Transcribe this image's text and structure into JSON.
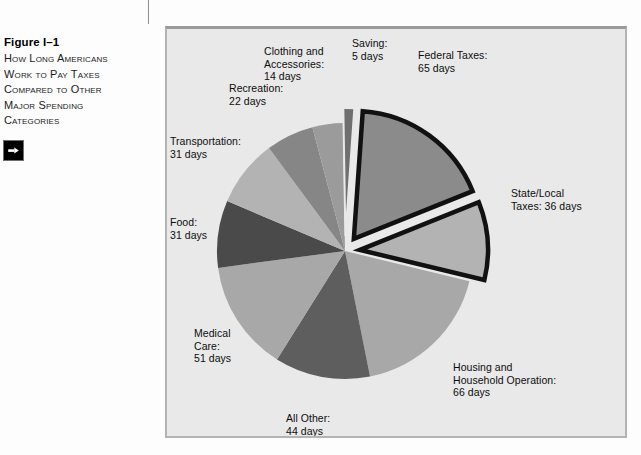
{
  "figure": {
    "number": "Figure I–1",
    "title_lines": [
      "How Long Americans",
      "Work to Pay Taxes",
      "Compared to Other",
      "Major Spending",
      "Categories"
    ],
    "arrow_icon": "arrow-right-icon"
  },
  "chart_data": {
    "type": "pie",
    "title": "How Long Americans Work to Pay Taxes Compared to Other Major Spending Categories",
    "unit": "days",
    "total_days": 365,
    "legend_position": "outside-labels",
    "grid": false,
    "labels": [
      "Federal Taxes",
      "State/Local Taxes",
      "Housing and Household Operation",
      "All Other",
      "Medical Care",
      "Food",
      "Transportation",
      "Recreation",
      "Clothing and Accessories",
      "Saving"
    ],
    "values": [
      65,
      36,
      66,
      44,
      51,
      31,
      31,
      22,
      14,
      5
    ],
    "slices": [
      {
        "label": "Federal Taxes",
        "days": 65,
        "exploded": true,
        "color": "#8b8b8b",
        "outline": "#111111"
      },
      {
        "label": "State/Local Taxes",
        "days": 36,
        "exploded": true,
        "color": "#b3b3b3",
        "outline": "#111111"
      },
      {
        "label": "Housing and Household Operation",
        "days": 66,
        "exploded": false,
        "color": "#a8a8a8",
        "outline": "none"
      },
      {
        "label": "All Other",
        "days": 44,
        "exploded": false,
        "color": "#5e5e5e",
        "outline": "none"
      },
      {
        "label": "Medical Care",
        "days": 51,
        "exploded": false,
        "color": "#a8a8a8",
        "outline": "none"
      },
      {
        "label": "Food",
        "days": 31,
        "exploded": false,
        "color": "#4a4a4a",
        "outline": "none"
      },
      {
        "label": "Transportation",
        "days": 31,
        "exploded": false,
        "color": "#b3b3b3",
        "outline": "none"
      },
      {
        "label": "Recreation",
        "days": 22,
        "exploded": false,
        "color": "#868686",
        "outline": "none"
      },
      {
        "label": "Clothing and Accessories",
        "days": 14,
        "exploded": false,
        "color": "#9b9b9b",
        "outline": "none"
      },
      {
        "label": "Saving",
        "days": 5,
        "exploded": true,
        "color": "#6f6f6f",
        "outline": "none"
      }
    ]
  },
  "labels": {
    "federal": "Federal Taxes:\n65 days",
    "state_local": "State/Local\nTaxes: 36 days",
    "housing": "Housing and\nHousehold Operation:\n66 days",
    "all_other": "All Other:\n44 days",
    "medical": "Medical\nCare:\n51 days",
    "food": "Food:\n31 days",
    "transportation": "Transportation:\n31 days",
    "recreation": "Recreation:\n22 days",
    "clothing": "Clothing and\nAccessories:\n14 days",
    "saving": "Saving:\n5 days"
  },
  "colors": {
    "panel_background": "#e9e9e9",
    "panel_border": "#b4b4b4",
    "page_background": "#fdfdfd",
    "text": "#0d0d0d",
    "pie_outline_dark": "#111111"
  }
}
